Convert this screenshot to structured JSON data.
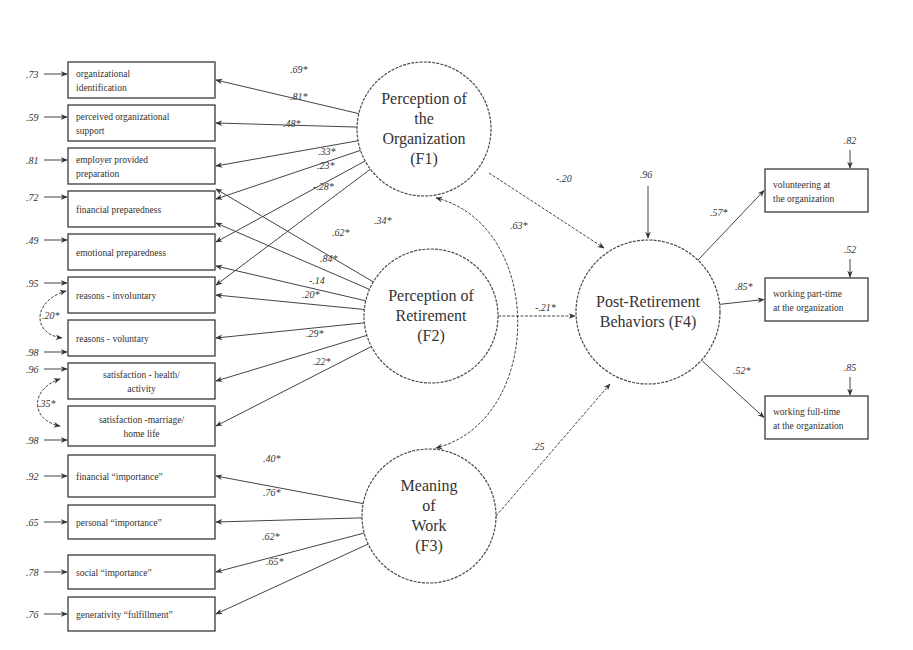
{
  "observed_left": [
    {
      "id": "org_ident",
      "lines": [
        "organizational",
        "identification"
      ],
      "error": ".73",
      "y": 62,
      "h": 36
    },
    {
      "id": "perc_org_support",
      "lines": [
        "perceived organizational",
        "support"
      ],
      "error": ".59",
      "y": 105,
      "h": 36
    },
    {
      "id": "employer_prep",
      "lines": [
        "employer provided",
        "preparation"
      ],
      "error": ".81",
      "y": 148,
      "h": 36
    },
    {
      "id": "fin_prep",
      "lines": [
        "financial preparedness"
      ],
      "error": ".72",
      "y": 191,
      "h": 36
    },
    {
      "id": "emo_prep",
      "lines": [
        "emotional preparedness"
      ],
      "error": ".49",
      "y": 234,
      "h": 36
    },
    {
      "id": "reasons_invol",
      "lines": [
        "reasons - involuntary"
      ],
      "error": ".95",
      "y": 277,
      "h": 36
    },
    {
      "id": "reasons_vol",
      "lines": [
        "reasons - voluntary"
      ],
      "error": ".98",
      "y": 320,
      "h": 36
    },
    {
      "id": "sat_health",
      "lines": [
        "satisfaction - health/",
        "activity"
      ],
      "error": ".96",
      "y": 363,
      "h": 36
    },
    {
      "id": "sat_marriage",
      "lines": [
        "satisfaction -marriage/",
        "home life"
      ],
      "error": ".98",
      "y": 406,
      "h": 40
    },
    {
      "id": "fin_importance",
      "lines": [
        "financial “importance”"
      ],
      "error": ".92",
      "y": 455,
      "h": 42
    },
    {
      "id": "pers_importance",
      "lines": [
        "personal “importance”"
      ],
      "error": ".65",
      "y": 505,
      "h": 34
    },
    {
      "id": "soc_importance",
      "lines": [
        "social “importance”"
      ],
      "error": ".78",
      "y": 555,
      "h": 34
    },
    {
      "id": "gen_fulfillment",
      "lines": [
        "generativity “fulfillment”"
      ],
      "error": ".76",
      "y": 597,
      "h": 34
    }
  ],
  "observed_right": [
    {
      "id": "volunteering",
      "lines": [
        "volunteering at",
        "the organization"
      ],
      "error": ".82",
      "y": 169,
      "h": 43
    },
    {
      "id": "part_time",
      "lines": [
        "working part-time",
        "at the organization"
      ],
      "error": ".52",
      "y": 278,
      "h": 43
    },
    {
      "id": "full_time",
      "lines": [
        "working full-time",
        "at the organization"
      ],
      "error": ".85",
      "y": 396,
      "h": 43
    }
  ],
  "factors": [
    {
      "id": "F1",
      "lines": [
        "Perception of",
        "the",
        "Organization",
        "(F1)"
      ],
      "cx": 424,
      "cy": 129,
      "r": 67
    },
    {
      "id": "F2",
      "lines": [
        "Perception of",
        "Retirement",
        "(F2)"
      ],
      "cx": 431,
      "cy": 316,
      "r": 67
    },
    {
      "id": "F3",
      "lines": [
        "Meaning",
        "of",
        "Work",
        "(F3)"
      ],
      "cx": 429,
      "cy": 516,
      "r": 67
    },
    {
      "id": "F4",
      "lines": [
        "Post-Retirement",
        "Behaviors (F4)"
      ],
      "cx": 648,
      "cy": 312,
      "r": 72
    }
  ],
  "f4_disturbance": ".96",
  "loadings": [
    {
      "from": "F1",
      "to": "org_ident",
      "label": ".69*"
    },
    {
      "from": "F1",
      "to": "perc_org_support",
      "label": ".81*"
    },
    {
      "from": "F1",
      "to": "employer_prep",
      "label": ".48*"
    },
    {
      "from": "F1",
      "to": "fin_prep",
      "label": ".33*"
    },
    {
      "from": "F1",
      "to": "emo_prep",
      "label": ".23*"
    },
    {
      "from": "F1",
      "to": "reasons_invol",
      "label": "-.28*"
    },
    {
      "from": "F2",
      "to": "employer_prep",
      "label": ".34*"
    },
    {
      "from": "F2",
      "to": "fin_prep",
      "label": ".62*"
    },
    {
      "from": "F2",
      "to": "emo_prep",
      "label": ".84*"
    },
    {
      "from": "F2",
      "to": "reasons_invol",
      "label": "-.14"
    },
    {
      "from": "F2",
      "to": "reasons_vol",
      "label": ".20*"
    },
    {
      "from": "F2",
      "to": "sat_health",
      "label": ".29*"
    },
    {
      "from": "F2",
      "to": "sat_marriage",
      "label": ".22*"
    },
    {
      "from": "F3",
      "to": "fin_importance",
      "label": ".40*"
    },
    {
      "from": "F3",
      "to": "pers_importance",
      "label": ".76*"
    },
    {
      "from": "F3",
      "to": "soc_importance",
      "label": ".62*"
    },
    {
      "from": "F3",
      "to": "gen_fulfillment",
      "label": ".65*"
    },
    {
      "from": "F4",
      "to": "volunteering",
      "label": ".57*"
    },
    {
      "from": "F4",
      "to": "part_time",
      "label": ".85*"
    },
    {
      "from": "F4",
      "to": "full_time",
      "label": ".52*"
    }
  ],
  "structural_paths": [
    {
      "from": "F1",
      "to": "F4",
      "label": "-.20"
    },
    {
      "from": "F2",
      "to": "F4",
      "label": "-.21*"
    },
    {
      "from": "F3",
      "to": "F4",
      "label": ".25"
    }
  ],
  "correlations": [
    {
      "between": [
        "F1",
        "F3"
      ],
      "label": ".63*"
    },
    {
      "between": [
        "reasons_invol",
        "reasons_vol"
      ],
      "label": ".20*"
    },
    {
      "between": [
        "sat_health",
        "sat_marriage"
      ],
      "label": ".35*"
    }
  ],
  "colors": {
    "stroke": "#3a3a3a",
    "text": "#333333",
    "background": "#ffffff"
  }
}
